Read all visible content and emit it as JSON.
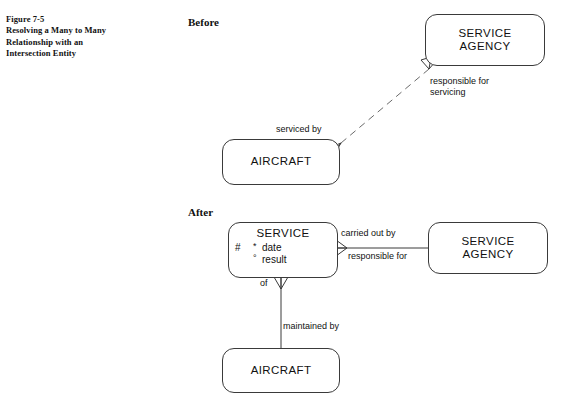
{
  "caption": {
    "lines": [
      "Figure 7-5",
      "Resolving a Many to Many",
      "Relationship with an",
      "Intersection Entity"
    ]
  },
  "sections": {
    "before_label": "Before",
    "after_label": "After"
  },
  "before": {
    "agency_entity": {
      "name": "SERVICE",
      "name2": "AGENCY"
    },
    "aircraft_entity": {
      "name": "AIRCRAFT"
    },
    "relationship": {
      "from_aircraft_label": "serviced by",
      "to_agency_label_line1": "responsible for",
      "to_agency_label_line2": "servicing",
      "line_style": "dashed",
      "end_markers": "crows-foot both ends"
    }
  },
  "after": {
    "service_entity": {
      "name": "SERVICE",
      "attributes": [
        {
          "key": "#",
          "marker": "*",
          "name": "date"
        },
        {
          "key": "",
          "marker": "°",
          "name": "result"
        }
      ]
    },
    "agency_entity": {
      "name": "SERVICE",
      "name2": "AGENCY"
    },
    "aircraft_entity": {
      "name": "AIRCRAFT"
    },
    "relationships": {
      "service_to_agency_top": "carried out by",
      "service_to_agency_bottom": "responsible for",
      "service_to_aircraft_top": "of",
      "service_to_aircraft_bottom": "maintained by"
    }
  },
  "colors": {
    "stroke": "#3a3a3a",
    "dashed_stroke": "#6a6a6a",
    "background": "#ffffff",
    "text": "#111111"
  }
}
